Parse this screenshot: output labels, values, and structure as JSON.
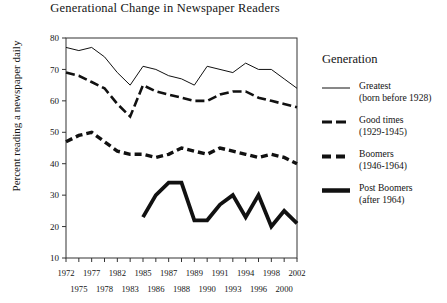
{
  "chart_data": {
    "type": "line",
    "title": "Generational Change in Newspaper Readers",
    "xlabel": "",
    "ylabel": "Percent reading a newspaper daily",
    "ylim": [
      10,
      80
    ],
    "yticks": [
      10,
      20,
      30,
      40,
      50,
      60,
      70,
      80
    ],
    "grid": false,
    "legend_position": "right",
    "legend_title": "Generation",
    "x": [
      1972,
      1975,
      1977,
      1978,
      1982,
      1983,
      1985,
      1986,
      1987,
      1988,
      1989,
      1990,
      1991,
      1993,
      1994,
      1996,
      1998,
      2000,
      2002
    ],
    "xticks_top": [
      "1972",
      "1977",
      "1982",
      "1985",
      "1987",
      "1989",
      "1991",
      "1994",
      "1998",
      "2002"
    ],
    "xticks_bottom": [
      "1975",
      "1978",
      "1983",
      "1986",
      "1988",
      "1990",
      "1993",
      "1996",
      "2000"
    ],
    "series": [
      {
        "name": "Greatest",
        "sub": "(born before 1928)",
        "style": "thin-solid",
        "values": [
          77,
          76,
          77,
          74,
          69,
          65,
          71,
          70,
          68,
          67,
          65,
          71,
          70,
          69,
          72,
          70,
          70,
          67,
          64
        ]
      },
      {
        "name": "Good times",
        "sub": "(1929-1945)",
        "style": "long-dash",
        "values": [
          69,
          68,
          66,
          64,
          59,
          55,
          65,
          63,
          62,
          61,
          60,
          60,
          62,
          63,
          63,
          61,
          60,
          59,
          58
        ]
      },
      {
        "name": "Boomers",
        "sub": "(1946-1964)",
        "style": "short-dash-thick",
        "values": [
          47,
          49,
          50,
          47,
          44,
          43,
          43,
          42,
          43,
          45,
          44,
          43,
          45,
          44,
          43,
          42,
          43,
          42,
          40
        ]
      },
      {
        "name": "Post Boomers",
        "sub": "(after 1964)",
        "style": "thick-solid",
        "values": [
          null,
          null,
          null,
          null,
          null,
          null,
          23,
          30,
          34,
          34,
          22,
          22,
          27,
          30,
          23,
          30,
          20,
          25,
          21
        ]
      }
    ]
  },
  "legend": {
    "title": "Generation",
    "entries": [
      {
        "label": "Greatest",
        "sub": "(born before 1928)"
      },
      {
        "label": "Good times",
        "sub": "(1929-1945)"
      },
      {
        "label": "Boomers",
        "sub": "(1946-1964)"
      },
      {
        "label": "Post Boomers",
        "sub": "(after 1964)"
      }
    ]
  }
}
